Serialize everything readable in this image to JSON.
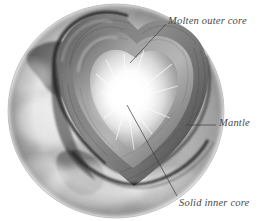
{
  "figure": {
    "background_color": "#ffffff",
    "label_color": "#4a4a4a",
    "leader_line_color": "#3c3c3c",
    "labels": [
      {
        "id": "molten-outer-core",
        "text": "Molten outer core",
        "leader_from": [
          166,
          24
        ],
        "leader_to": [
          130,
          63
        ]
      },
      {
        "id": "mantle",
        "text": "Mantle",
        "leader_from": [
          216,
          125
        ],
        "leader_to": [
          186,
          125
        ]
      },
      {
        "id": "solid-inner-core",
        "text": "Solid inner core",
        "leader_from": [
          177,
          196
        ],
        "leader_to": [
          127,
          105
        ]
      }
    ],
    "layers": [
      {
        "name": "crust-surface",
        "label": "Earth surface",
        "color": "#8e8e8e"
      },
      {
        "name": "mantle",
        "label": "Mantle",
        "color": "#6e6e6e"
      },
      {
        "name": "molten-outer-core",
        "label": "Molten outer core",
        "color": "#9a9a9a"
      },
      {
        "name": "solid-inner-core",
        "label": "Solid inner core",
        "color": "#ffffff"
      }
    ]
  }
}
